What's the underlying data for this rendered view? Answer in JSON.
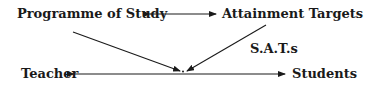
{
  "diagram": {
    "nodes": {
      "programme": {
        "label": "Programme of Study"
      },
      "attainment": {
        "label": "Attainment Targets"
      },
      "sats": {
        "label": "S.A.T.s"
      },
      "teacher": {
        "label": "Teacher"
      },
      "students": {
        "label": "Students"
      }
    },
    "edges": [
      {
        "from": "Programme of Study",
        "to": "Attainment Targets",
        "type": "bidirectional"
      },
      {
        "from": "Programme of Study",
        "to": "center",
        "type": "directed"
      },
      {
        "from": "Attainment Targets",
        "to": "center",
        "type": "directed"
      },
      {
        "from": "Teacher",
        "to": "Students",
        "type": "bidirectional",
        "through": "center"
      }
    ],
    "colors": {
      "ink": "#1a1a1a",
      "background": "#ffffff"
    }
  }
}
